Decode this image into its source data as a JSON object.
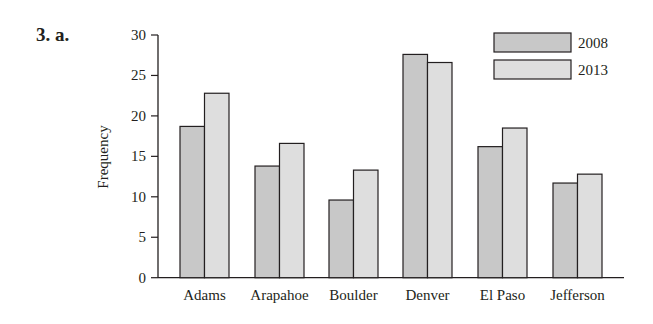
{
  "problem_label": "3. a.",
  "chart_data": {
    "type": "bar",
    "title": "",
    "xlabel": "",
    "ylabel": "Frequency",
    "ylim": [
      0,
      30
    ],
    "yticks": [
      0,
      5,
      10,
      15,
      20,
      25,
      30
    ],
    "grid": false,
    "legend_position": "top-right",
    "categories": [
      "Adams",
      "Arapahoe",
      "Boulder",
      "Denver",
      "El Paso",
      "Jefferson"
    ],
    "series": [
      {
        "name": "2008",
        "color": "#c8c8c8",
        "values": [
          18.7,
          13.8,
          9.6,
          27.6,
          16.2,
          11.7
        ]
      },
      {
        "name": "2013",
        "color": "#dedede",
        "values": [
          22.8,
          16.6,
          13.3,
          26.6,
          18.5,
          12.8
        ]
      }
    ]
  }
}
